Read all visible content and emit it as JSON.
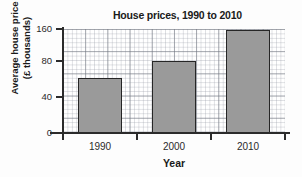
{
  "chart_data": {
    "type": "bar",
    "title": "House prices, 1990 to 2010",
    "xlabel": "Year",
    "ylabel_line1": "Average house price",
    "ylabel_line2": "(£ thousands)",
    "categories": [
      "1990",
      "2000",
      "2010"
    ],
    "values": [
      61,
      81,
      157
    ],
    "series": [
      {
        "name": "Average house price",
        "values": [
          61,
          81,
          157
        ]
      }
    ],
    "ylim": [
      0,
      160
    ],
    "ytick_labels": [
      "0",
      "40",
      "80",
      "160"
    ],
    "ytick_values": [
      0,
      40,
      80,
      160
    ],
    "xtick_labels": [
      "1990",
      "2000",
      "2010"
    ],
    "grid": true,
    "grid_style": "graph-paper",
    "legend": "none",
    "bar_color": "#9a9a9a",
    "bar_edge_color": "#262626",
    "axis_color": "#2b2b2b",
    "background_color": "#ffffff"
  }
}
